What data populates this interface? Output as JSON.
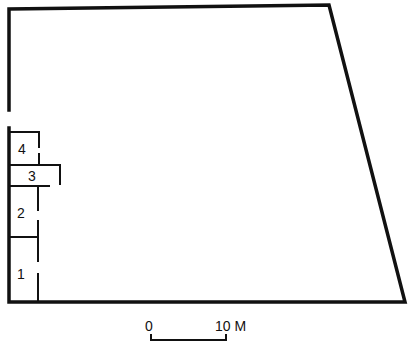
{
  "plan": {
    "rooms": [
      {
        "label": "1"
      },
      {
        "label": "2"
      },
      {
        "label": "3"
      },
      {
        "label": "4"
      }
    ]
  },
  "scale_bar": {
    "start_label": "0",
    "end_label": "10 M"
  },
  "colors": {
    "line": "#111111",
    "background": "#ffffff"
  }
}
